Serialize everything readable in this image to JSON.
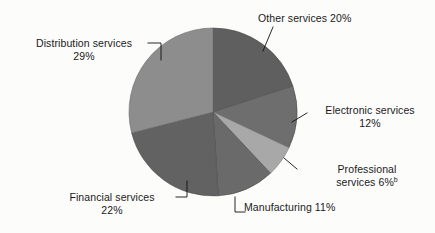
{
  "figure": {
    "background_color": "#fcfcfb",
    "text_color": "#1a1a1a"
  },
  "chart_data": {
    "type": "pie",
    "title": "",
    "subtitle": "",
    "xlabel": "",
    "ylabel": "",
    "legend_position": "none",
    "labels_position": "outside-with-leader-lines",
    "grid": false,
    "start_angle_deg": 0,
    "direction": "clockwise",
    "categories": [
      "Other services",
      "Electronic services",
      "Professional services",
      "Manufacturing",
      "Financial services",
      "Distribution services"
    ],
    "values": [
      20,
      12,
      6,
      11,
      22,
      29
    ],
    "units": "percent",
    "total": 100,
    "colors": [
      "#5f5f5f",
      "#6e6e6e",
      "#a8a8a8",
      "#6a6a6a",
      "#626262",
      "#8d8d8d"
    ],
    "footnotes": [
      "b"
    ],
    "slices": [
      {
        "name": "Other services",
        "value": 20,
        "value_text": "20%",
        "color": "#5f5f5f",
        "footnote": "",
        "label_lines": [
          "Other services 20%"
        ]
      },
      {
        "name": "Electronic services",
        "value": 12,
        "value_text": "12%",
        "color": "#6e6e6e",
        "footnote": "",
        "label_lines": [
          "Electronic services",
          "12%"
        ]
      },
      {
        "name": "Professional services",
        "value": 6,
        "value_text": "6%",
        "color": "#a8a8a8",
        "footnote": "b",
        "label_lines": [
          "Professional",
          "services  6%"
        ]
      },
      {
        "name": "Manufacturing",
        "value": 11,
        "value_text": "11%",
        "color": "#6a6a6a",
        "footnote": "",
        "label_lines": [
          "Manufacturing 11%"
        ]
      },
      {
        "name": "Financial services",
        "value": 22,
        "value_text": "22%",
        "color": "#626262",
        "footnote": "",
        "label_lines": [
          "Financial services",
          "22%"
        ]
      },
      {
        "name": "Distribution services",
        "value": 29,
        "value_text": "29%",
        "color": "#8d8d8d",
        "footnote": "",
        "label_lines": [
          "Distribution services",
          "29%"
        ]
      }
    ]
  },
  "labels": {
    "other": {
      "line1": "Other services 20%"
    },
    "distribution": {
      "line1": "Distribution services",
      "line2": "29%"
    },
    "electronic": {
      "line1": "Electronic services",
      "line2": "12%"
    },
    "professional": {
      "line1": "Professional",
      "line2": "services  6%",
      "footnote": "b"
    },
    "manufacturing": {
      "line1": "Manufacturing 11%"
    },
    "financial": {
      "line1": "Financial services",
      "line2": "22%"
    }
  }
}
